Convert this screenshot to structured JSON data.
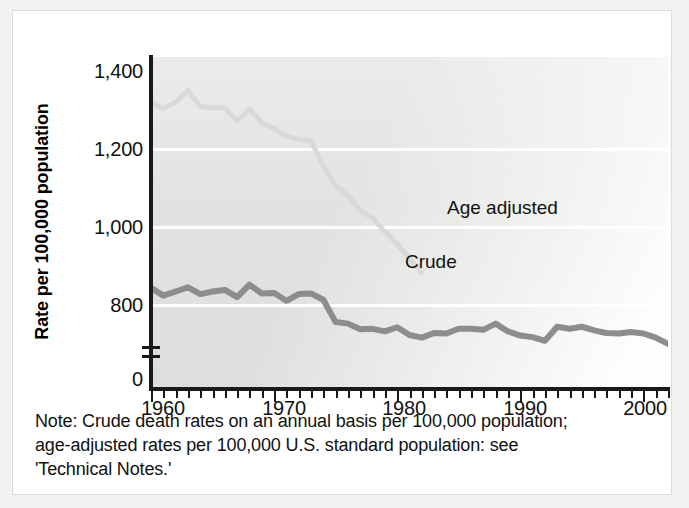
{
  "figure": {
    "ytitle": "Rate per 100,000 population",
    "note_lines": [
      "Note: Crude death rates on an annual basis per 100,000 population;",
      "age-adjusted rates per 100,000 U.S. standard population: see",
      "'Technical Notes.'"
    ]
  },
  "axes": {
    "y_ticks": [
      "1,400",
      "1,200",
      "1,000",
      "800",
      "0"
    ],
    "x_ticks": [
      "1960",
      "1970",
      "1980",
      "1990",
      "2000"
    ]
  },
  "labels": {
    "age_adjusted": "Age adjusted",
    "crude": "Crude"
  },
  "colors": {
    "crude_line": "#8d8d8d",
    "age_adjusted_line": "#d9d9d9",
    "gridline": "#ffffff",
    "axis": "#1a1a1a",
    "plot_background": "#e3e3e1",
    "text": "#111111"
  },
  "chart_data": {
    "type": "line",
    "title": "",
    "subtitle": "",
    "xlabel": "",
    "ylabel": "Rate per 100,000 population",
    "xlim": [
      1960,
      2002
    ],
    "ylim": [
      760,
      1400
    ],
    "y_axis_break": true,
    "y_axis_break_note": "axis broken between 0 and 760",
    "grid": "horizontal gridlines at 800, 1,000, 1,200 (white)",
    "legend": "inline series labels inside plot area",
    "x": [
      1960,
      1961,
      1962,
      1963,
      1964,
      1965,
      1966,
      1967,
      1968,
      1969,
      1970,
      1971,
      1972,
      1973,
      1974,
      1975,
      1976,
      1977,
      1978,
      1979,
      1980,
      1981,
      1982,
      1983,
      1984,
      1985,
      1986,
      1987,
      1988,
      1989,
      1990,
      1991,
      1992,
      1993,
      1994,
      1995,
      1996,
      1997,
      1998,
      1999,
      2000,
      2001,
      2002
    ],
    "series": [
      {
        "name": "Age adjusted",
        "color": "#d9d9d9",
        "visible_range": [
          1960,
          1982
        ],
        "values": [
          1313,
          1301,
          1313,
          1335,
          1305,
          1302,
          1302,
          1277,
          1299,
          1273,
          1262,
          1247,
          1241,
          1239,
          1189,
          1152,
          1133,
          1104,
          1090,
          1063,
          1039,
          1012,
          984,
          974,
          967,
          965,
          962,
          958,
          950,
          933,
          939,
          926,
          910,
          920,
          917,
          910,
          901,
          888,
          884,
          882,
          869,
          858,
          845
        ]
      },
      {
        "name": "Crude",
        "color": "#8d8d8d",
        "visible_range": [
          1960,
          2002
        ],
        "values": [
          955,
          940,
          948,
          956,
          943,
          948,
          951,
          937,
          961,
          944,
          945,
          930,
          943,
          944,
          932,
          889,
          886,
          875,
          876,
          871,
          879,
          864,
          859,
          868,
          867,
          876,
          876,
          874,
          886,
          871,
          863,
          860,
          853,
          880,
          876,
          880,
          873,
          868,
          867,
          870,
          867,
          859,
          847
        ]
      }
    ]
  }
}
